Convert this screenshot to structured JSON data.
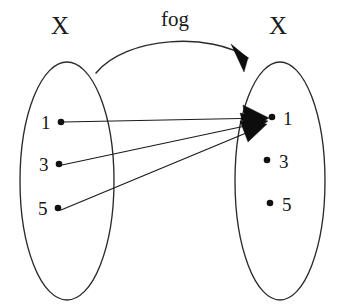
{
  "figure": {
    "kind": "set-mapping-diagram",
    "background_color": "#ffffff",
    "ink_color": "#1a1a1a",
    "width": 338,
    "height": 308
  },
  "mapping_label": {
    "text": "fog",
    "meaning": "f composed with g",
    "x": 175,
    "y": 26
  },
  "domain_set": {
    "title": "X",
    "title_x": 60,
    "title_y": 34,
    "ellipse": {
      "cx": 67,
      "cy": 181,
      "rx": 47,
      "ry": 119
    },
    "elements": [
      {
        "label": "1",
        "dot_x": 61,
        "dot_y": 122,
        "label_x": 41,
        "label_y": 129
      },
      {
        "label": "3",
        "dot_x": 59,
        "dot_y": 164,
        "label_x": 39,
        "label_y": 171
      },
      {
        "label": "5",
        "dot_x": 58,
        "dot_y": 208,
        "label_x": 38,
        "label_y": 215
      }
    ]
  },
  "codomain_set": {
    "title": "X",
    "title_x": 278,
    "title_y": 34,
    "ellipse": {
      "cx": 280,
      "cy": 181,
      "rx": 45,
      "ry": 119
    },
    "elements": [
      {
        "label": "1",
        "dot_x": 272,
        "dot_y": 117,
        "label_x": 283,
        "label_y": 125
      },
      {
        "label": "3",
        "dot_x": 267,
        "dot_y": 160,
        "label_x": 279,
        "label_y": 168
      },
      {
        "label": "5",
        "dot_x": 270,
        "dot_y": 203,
        "label_x": 282,
        "label_y": 211
      }
    ]
  },
  "mapping_arc": {
    "path": "M 96 73 C 126 36, 212 32, 248 58",
    "arrowhead_points": "248,58 231,44 244,72"
  },
  "edges": [
    {
      "name": "edge-1-to-1",
      "from": "1",
      "to": "1",
      "line": {
        "x1": 63,
        "y1": 122,
        "x2": 266,
        "y2": 118
      },
      "arrowhead_points": "269,118 243,105 246,131"
    },
    {
      "name": "edge-3-to-1",
      "from": "3",
      "to": "1",
      "line": {
        "x1": 62,
        "y1": 165,
        "x2": 264,
        "y2": 122
      },
      "arrowhead_points": "268,121 240,113 247,136"
    },
    {
      "name": "edge-5-to-1",
      "from": "5",
      "to": "1",
      "line": {
        "x1": 61,
        "y1": 210,
        "x2": 263,
        "y2": 126
      },
      "arrowhead_points": "267,124 240,121 248,142"
    }
  ]
}
